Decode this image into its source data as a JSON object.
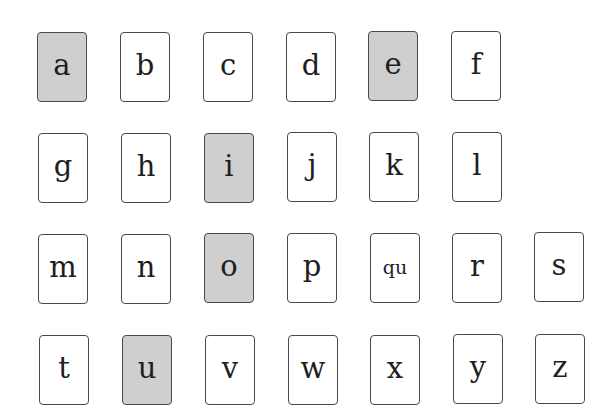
{
  "colors": {
    "vowel_fill": "#cfcfcf",
    "consonant_fill": "#ffffff",
    "border": "#4a4a4a",
    "text": "#1e1e1e"
  },
  "rows": [
    [
      {
        "label": "a",
        "vowel": true
      },
      {
        "label": "b",
        "vowel": false
      },
      {
        "label": "c",
        "vowel": false
      },
      {
        "label": "d",
        "vowel": false
      },
      {
        "label": "e",
        "vowel": true
      },
      {
        "label": "f",
        "vowel": false
      }
    ],
    [
      {
        "label": "g",
        "vowel": false
      },
      {
        "label": "h",
        "vowel": false
      },
      {
        "label": "i",
        "vowel": true
      },
      {
        "label": "j",
        "vowel": false
      },
      {
        "label": "k",
        "vowel": false
      },
      {
        "label": "l",
        "vowel": false
      }
    ],
    [
      {
        "label": "m",
        "vowel": false
      },
      {
        "label": "n",
        "vowel": false
      },
      {
        "label": "o",
        "vowel": true
      },
      {
        "label": "p",
        "vowel": false
      },
      {
        "label": "qu",
        "vowel": false
      },
      {
        "label": "r",
        "vowel": false
      },
      {
        "label": "s",
        "vowel": false
      }
    ],
    [
      {
        "label": "t",
        "vowel": false
      },
      {
        "label": "u",
        "vowel": true
      },
      {
        "label": "v",
        "vowel": false
      },
      {
        "label": "w",
        "vowel": false
      },
      {
        "label": "x",
        "vowel": false
      },
      {
        "label": "y",
        "vowel": false
      },
      {
        "label": "z",
        "vowel": false
      }
    ]
  ]
}
